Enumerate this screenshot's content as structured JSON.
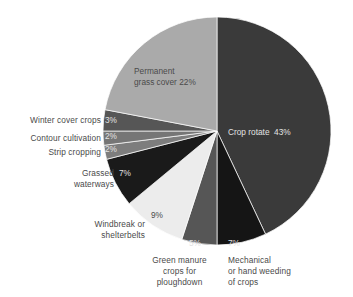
{
  "chart_data": {
    "type": "pie",
    "title": "",
    "subtitle": "",
    "xlabel": "",
    "ylabel": "",
    "legend_position": "none",
    "grid": false,
    "units": "percent",
    "total": 100,
    "categories": [
      "Crop rotate",
      "Mechanical or hand weeding of crops",
      "Green manure crops for ploughdown",
      "Windbreak or shelterbelts",
      "Grassed waterways",
      "Strip cropping",
      "Contour cultivation",
      "Winter cover crops",
      "Permanent grass cover"
    ],
    "values": [
      43,
      7,
      5,
      9,
      7,
      2,
      2,
      3,
      22
    ],
    "slice_colors": [
      "#3a3a3a",
      "#151515",
      "#565656",
      "#ececec",
      "#1a1a1a",
      "#7d7d7d",
      "#767676",
      "#565656",
      "#aaaaaa"
    ],
    "slices": [
      {
        "label": "Crop rotate",
        "value": 43,
        "value_text": "43%",
        "label_text": "Crop rotate  43%",
        "color": "#3a3a3a",
        "label_placement": "inside"
      },
      {
        "label": "Mechanical or hand weeding of crops",
        "value": 7,
        "value_text": "7%",
        "label_lines": [
          "Mechanical",
          "or hand weeding",
          "of crops"
        ],
        "color": "#151515",
        "label_placement": "outside-bottom"
      },
      {
        "label": "Green manure crops for ploughdown",
        "value": 5,
        "value_text": "5%",
        "label_lines": [
          "Green manure",
          "crops for",
          "ploughdown"
        ],
        "color": "#565656",
        "label_placement": "outside-bottom"
      },
      {
        "label": "Windbreak or shelterbelts",
        "value": 9,
        "value_text": "9%",
        "label_lines": [
          "Windbreak or",
          "shelterbelts"
        ],
        "color": "#ececec",
        "label_placement": "outside-bottom-left"
      },
      {
        "label": "Grassed waterways",
        "value": 7,
        "value_text": "7%",
        "label_lines": [
          "Grassed",
          "waterways"
        ],
        "color": "#1a1a1a",
        "label_placement": "outside-left"
      },
      {
        "label": "Strip cropping",
        "value": 2,
        "value_text": "2%",
        "label_lines": [
          "Strip cropping"
        ],
        "color": "#7d7d7d",
        "label_placement": "outside-left"
      },
      {
        "label": "Contour cultivation",
        "value": 2,
        "value_text": "2%",
        "label_lines": [
          "Contour cultivation"
        ],
        "color": "#767676",
        "label_placement": "outside-left"
      },
      {
        "label": "Winter cover crops",
        "value": 3,
        "value_text": "3%",
        "label_lines": [
          "Winter cover crops"
        ],
        "color": "#565656",
        "label_placement": "outside-left"
      },
      {
        "label": "Permanent grass cover",
        "value": 22,
        "value_text": "22%",
        "label_lines": [
          "Permanent",
          "grass cover 22%"
        ],
        "color": "#aaaaaa",
        "label_placement": "inside"
      }
    ]
  },
  "labels": {
    "crop_rotate": "Crop rotate  43%",
    "permanent_line1": "Permanent",
    "permanent_line2": "grass cover 22%",
    "winter_cover_crops": "Winter cover crops",
    "contour_cultivation": "Contour cultivation",
    "strip_cropping": "Strip cropping",
    "grassed_line1": "Grassed",
    "grassed_line2": "waterways",
    "windbreak_line1": "Windbreak or",
    "windbreak_line2": "shelterbelts",
    "green_manure_line1": "Green manure",
    "green_manure_line2": "crops for",
    "green_manure_line3": "ploughdown",
    "mechanical_line1": "Mechanical",
    "mechanical_line2": "or hand weeding",
    "mechanical_line3": "of crops"
  },
  "percents": {
    "winter_cover_crops": "3%",
    "contour_cultivation": "2%",
    "strip_cropping": "2%",
    "grassed_waterways": "7%",
    "windbreak": "9%",
    "green_manure": "5%",
    "mechanical": "7%"
  },
  "colors": {
    "background": "#ffffff",
    "text": "#4a4a4a",
    "text_on_dark": "#e3e3e3"
  }
}
